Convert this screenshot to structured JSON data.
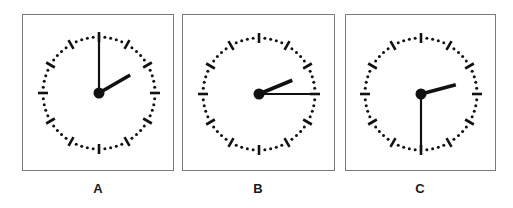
{
  "figure": {
    "panels": [
      {
        "label": "A",
        "time": "2:00",
        "hour": 2,
        "minute": 0,
        "box": {
          "x": 22,
          "y": 14,
          "w": 152,
          "h": 157
        },
        "center": {
          "x": 76,
          "y": 78
        }
      },
      {
        "label": "B",
        "time": "2:15",
        "hour": 2,
        "minute": 15,
        "box": {
          "x": 182,
          "y": 14,
          "w": 153,
          "h": 157
        },
        "center": {
          "x": 76,
          "y": 79
        }
      },
      {
        "label": "C",
        "time": "2:30",
        "hour": 2,
        "minute": 30,
        "box": {
          "x": 345,
          "y": 14,
          "w": 151,
          "h": 157
        },
        "center": {
          "x": 75,
          "y": 79
        }
      }
    ],
    "clock_style": {
      "radius": 56,
      "hour_ticks": 12,
      "minute_dots": 60,
      "minute_hand_length": 58,
      "hour_hand_length": 36,
      "ink_color": "#111111",
      "border_color": "#7a7a7a"
    }
  }
}
